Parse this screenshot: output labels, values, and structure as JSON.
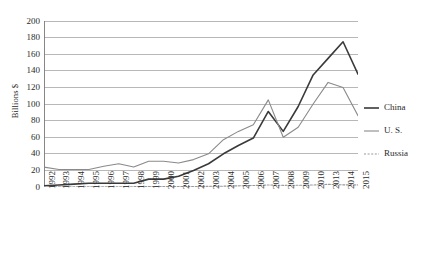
{
  "chart_data": {
    "type": "line",
    "title": "",
    "subtitle": "",
    "xlabel": "",
    "ylabel": "Billions $",
    "ylim": [
      0,
      200
    ],
    "ytick_step": 20,
    "yticks": [
      0,
      20,
      40,
      60,
      80,
      100,
      120,
      140,
      160,
      180,
      200
    ],
    "ytick_labels": [
      "0",
      "20",
      "40",
      "60",
      "80",
      "100",
      "120",
      "140",
      "160",
      "180",
      "200"
    ],
    "grid": "horizontal",
    "legend_position": "right",
    "categories": [
      "1992",
      "1993",
      "1994",
      "1995",
      "1996",
      "1997",
      "1998",
      "1999",
      "2000",
      "2001",
      "2002",
      "2003",
      "2004",
      "2005",
      "2006",
      "2007",
      "2008",
      "2009",
      "2010",
      "2013",
      "2014",
      "2015"
    ],
    "xtick_labels": [
      "1992",
      "1993",
      "1994",
      "1995",
      "1996",
      "1997",
      "1998",
      "1999",
      "2000",
      "2001",
      "2002",
      "2003",
      "2004",
      "2005",
      "2006",
      "2007",
      "2008",
      "2009",
      "2010",
      "2013",
      "2014",
      "2015"
    ],
    "series": [
      {
        "name": "China",
        "color": "#3a3a3a",
        "line_width": 1.6,
        "dash": "none",
        "values": [
          1.5,
          2.5,
          3.5,
          4.5,
          4.5,
          4.5,
          4.5,
          9.5,
          9.5,
          13,
          20,
          28,
          40,
          50,
          59,
          91,
          67,
          97,
          135,
          155,
          175,
          136
        ]
      },
      {
        "name": "U. S.",
        "color": "#8a8a8a",
        "line_width": 1.1,
        "dash": "none",
        "values": [
          24,
          21,
          21,
          21,
          25,
          28,
          24,
          31,
          31,
          29,
          33,
          40,
          57,
          67,
          75,
          105,
          60,
          72,
          100,
          126,
          120,
          86
        ]
      },
      {
        "name": "Russia",
        "color": "#9a9a9a",
        "line_width": 1.1,
        "dash": "2,1.6",
        "values": [
          0.2,
          0.2,
          0.2,
          0.3,
          0.3,
          0.3,
          0.4,
          0.4,
          0.5,
          0.5,
          0.6,
          0.8,
          1.0,
          1.4,
          1.8,
          2.4,
          2.0,
          2.1,
          2.4,
          3.2,
          2.6,
          2.5
        ]
      }
    ]
  },
  "axes": {
    "y_title": "Billions $"
  },
  "legend": {
    "items": [
      {
        "label": "China",
        "icon": "solid-line-swatch"
      },
      {
        "label": "U. S.",
        "icon": "solid-line-swatch"
      },
      {
        "label": "Russia",
        "icon": "dashed-line-swatch"
      }
    ]
  },
  "colors": {
    "china": "#3a3a3a",
    "us": "#8a8a8a",
    "russia": "#9a9a9a",
    "grid": "#a6a6a6",
    "axis": "#7a7a7a",
    "text": "#2b2b2b",
    "background": "#ffffff"
  }
}
